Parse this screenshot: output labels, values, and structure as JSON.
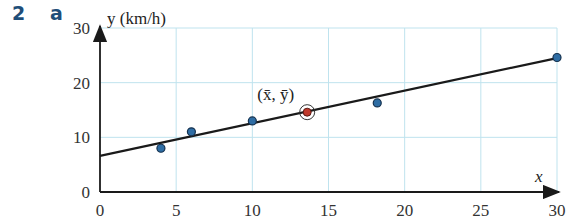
{
  "question": {
    "number": "2",
    "part": "a"
  },
  "chart_data": {
    "type": "scatter",
    "title": "",
    "xlabel": "x",
    "ylabel": "y (km/h)",
    "xlim": [
      0,
      30
    ],
    "ylim": [
      0,
      30
    ],
    "x_ticks": [
      "0",
      "5",
      "10",
      "15",
      "20",
      "25",
      "30"
    ],
    "y_ticks": [
      "0",
      "10",
      "20",
      "30"
    ],
    "grid": true,
    "points": [
      {
        "x": 4,
        "y": 8
      },
      {
        "x": 6,
        "y": 11
      },
      {
        "x": 10,
        "y": 13
      },
      {
        "x": 18.2,
        "y": 16.3
      },
      {
        "x": 30,
        "y": 24.6
      }
    ],
    "mean_point": {
      "x": 13.6,
      "y": 14.6,
      "label": "(x̄, ȳ)"
    },
    "regression_line": {
      "x0": 0,
      "y0": 6.6,
      "x1": 30,
      "y1": 24.5
    },
    "colors": {
      "point": "#2e6da4",
      "mean": "#c0392b",
      "line": "#1a1a1a",
      "grid": "#bfe3ee"
    }
  }
}
